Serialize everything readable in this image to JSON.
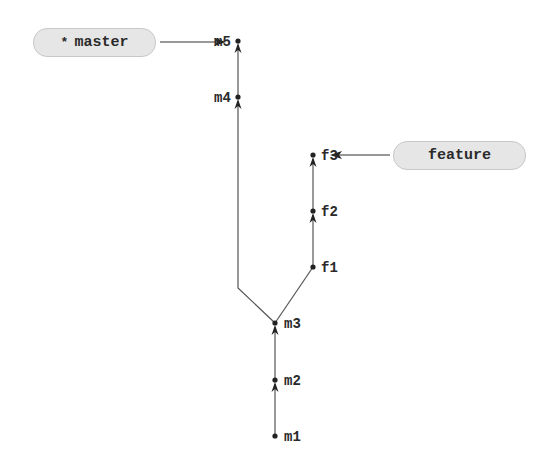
{
  "diagram": {
    "type": "git-commit-graph",
    "branches": [
      {
        "name": "master",
        "label": "master",
        "current": true,
        "current_marker": "*",
        "points_to": "m5"
      },
      {
        "name": "feature",
        "label": "feature",
        "current": false,
        "points_to": "f3"
      }
    ],
    "commits": [
      {
        "id": "m1",
        "label": "m1",
        "parent": null
      },
      {
        "id": "m2",
        "label": "m2",
        "parent": "m1"
      },
      {
        "id": "m3",
        "label": "m3",
        "parent": "m2"
      },
      {
        "id": "m4",
        "label": "m4",
        "parent": "m3"
      },
      {
        "id": "m5",
        "label": "m5",
        "parent": "m4"
      },
      {
        "id": "f1",
        "label": "f1",
        "parent": "m3"
      },
      {
        "id": "f2",
        "label": "f2",
        "parent": "f1"
      },
      {
        "id": "f3",
        "label": "f3",
        "parent": "f2"
      }
    ],
    "colors": {
      "line": "#333333",
      "pill_fill": "#e6e6e6",
      "pill_border": "#c8c8c8",
      "text": "#2a2a2a"
    }
  }
}
